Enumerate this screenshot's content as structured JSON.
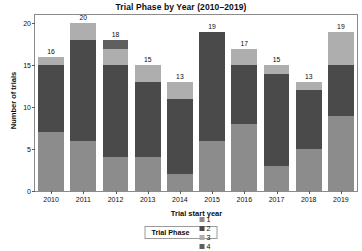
{
  "chart_data": {
    "type": "bar",
    "title": "Trial Phase by Year (2010–2019)",
    "xlabel": "Trial start year",
    "ylabel": "Number of trials",
    "stacked": true,
    "grid": false,
    "legend_position": "bottom",
    "legend_title": "Trial Phase",
    "ylim": [
      0,
      21
    ],
    "yticks": [
      0,
      5,
      10,
      15,
      20
    ],
    "ytick_labels": [
      "0",
      "5",
      "10",
      "15",
      "20"
    ],
    "categories": [
      "2010",
      "2011",
      "2012",
      "2013",
      "2014",
      "2015",
      "2016",
      "2017",
      "2018",
      "2019"
    ],
    "series": [
      {
        "name": "1",
        "color": "#8c8c8c",
        "values": [
          7,
          6,
          4,
          4,
          2,
          6,
          8,
          3,
          5,
          9
        ]
      },
      {
        "name": "2",
        "color": "#4a4a4a",
        "values": [
          8,
          12,
          11,
          9,
          9,
          13,
          7,
          11,
          7,
          6
        ]
      },
      {
        "name": "3",
        "color": "#aeaeae",
        "values": [
          1,
          2,
          2,
          2,
          2,
          0,
          2,
          1,
          1,
          4
        ]
      },
      {
        "name": "4",
        "color": "#5f5f5f",
        "values": [
          0,
          0,
          1,
          0,
          0,
          0,
          0,
          0,
          0,
          0
        ]
      }
    ],
    "totals": [
      16,
      20,
      18,
      15,
      13,
      19,
      17,
      15,
      13,
      19
    ],
    "total_labels": [
      "16",
      "20",
      "18",
      "15",
      "13",
      "19",
      "17",
      "15",
      "13",
      "19"
    ],
    "panel_border_color": "#8a8a8a",
    "background_color": "#ffffff",
    "text_color": "#0d0d0d"
  }
}
